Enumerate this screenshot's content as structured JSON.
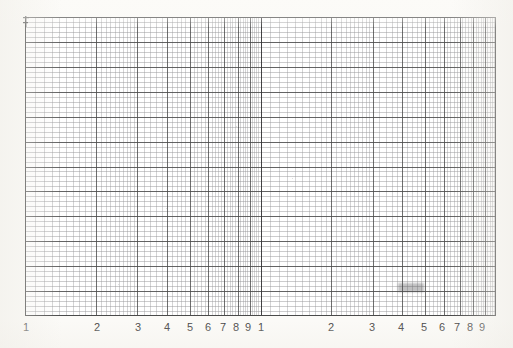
{
  "document": {
    "kind": "semi-logarithmic graph paper",
    "background_color": "#fbfaf7",
    "plot_background_color": "#ffffff"
  },
  "chart_data": {
    "type": "line",
    "title": "",
    "subtitle": "",
    "xlabel": "",
    "ylabel": "",
    "grid": true,
    "legend": null,
    "series": [],
    "x_axis": {
      "scale": "log",
      "decades": 2,
      "xlim": [
        1,
        100
      ],
      "tick_labels": [
        "1",
        "2",
        "3",
        "4",
        "5",
        "6",
        "7",
        "8",
        "9",
        "1",
        "2",
        "3",
        "4",
        "5",
        "6",
        "7",
        "8",
        "9"
      ],
      "tick_values": [
        1,
        2,
        3,
        4,
        5,
        6,
        7,
        8,
        9,
        10,
        20,
        30,
        40,
        50,
        60,
        70,
        80,
        90
      ],
      "minor_ticks": true
    },
    "y_axis": {
      "scale": "linear",
      "ylim": [
        0,
        60
      ],
      "tick_labels": [],
      "major_every": 5,
      "minor_divisions": 60
    }
  },
  "axis_labels": [
    {
      "text": "1",
      "x": 26
    },
    {
      "text": "2",
      "x": 97
    },
    {
      "text": "3",
      "x": 138
    },
    {
      "text": "4",
      "x": 167
    },
    {
      "text": "5",
      "x": 190
    },
    {
      "text": "6",
      "x": 208
    },
    {
      "text": "7",
      "x": 223
    },
    {
      "text": "8",
      "x": 236
    },
    {
      "text": "9",
      "x": 248
    },
    {
      "text": "1",
      "x": 261
    },
    {
      "text": "2",
      "x": 331
    },
    {
      "text": "3",
      "x": 372
    },
    {
      "text": "4",
      "x": 401
    },
    {
      "text": "5",
      "x": 424
    },
    {
      "text": "6",
      "x": 442
    },
    {
      "text": "7",
      "x": 457
    },
    {
      "text": "8",
      "x": 470
    },
    {
      "text": "9",
      "x": 482
    }
  ],
  "colors": {
    "minor_grid": "#9a9a9c",
    "major_grid": "#4a4a4a",
    "decade_line": "#333335",
    "label_text": "#3b3b3b",
    "paper": "#fbfaf7"
  }
}
